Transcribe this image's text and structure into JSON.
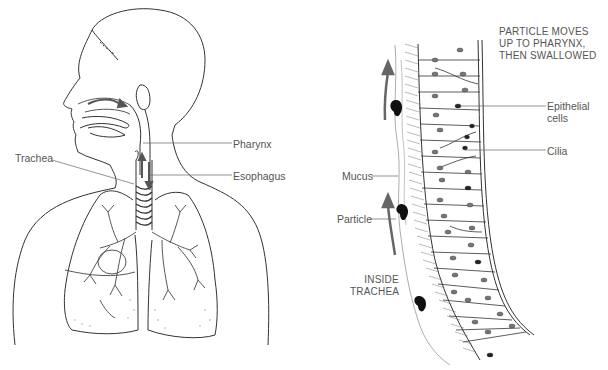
{
  "figure": {
    "left_panel": {
      "title": "Respiratory system overview",
      "labels": {
        "pharynx": "Pharynx",
        "esophagus": "Esophagus",
        "trachea": "Trachea"
      }
    },
    "right_panel": {
      "title": "Ciliated epithelium inside trachea",
      "caption_top": [
        "PARTICLE MOVES",
        "UP TO PHARYNX,",
        "THEN SWALLOWED"
      ],
      "caption_bottom": [
        "INSIDE",
        "TRACHEA"
      ],
      "labels": {
        "epithelial_cells": [
          "Epithelial",
          "cells"
        ],
        "cilia": "Cilia",
        "mucus": "Mucus",
        "particle": "Particle"
      }
    },
    "colors": {
      "line": "#333333",
      "label_text": "#555555",
      "arrow": "#666666",
      "particle": "#111111"
    }
  }
}
